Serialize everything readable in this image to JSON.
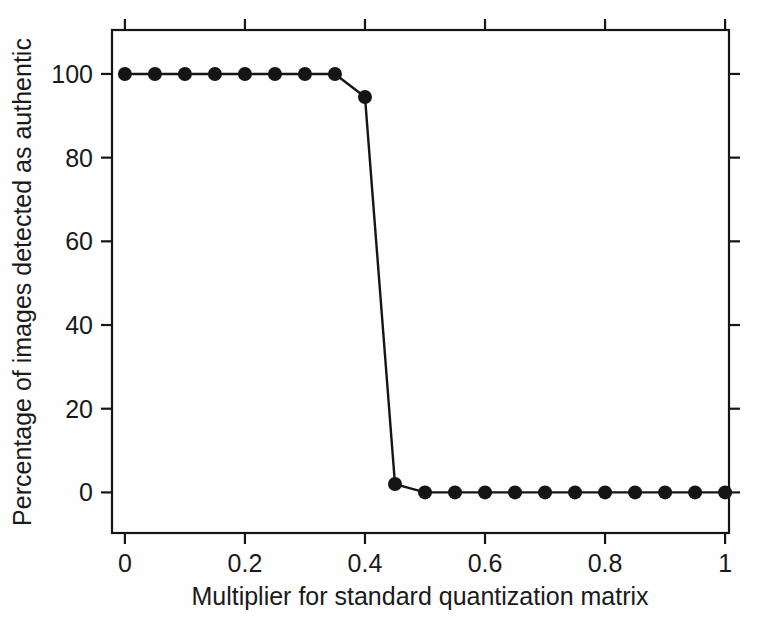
{
  "figure": {
    "background_color": "#fefefe",
    "ink_color": "#151515",
    "frame": {
      "left": 112,
      "right": 729,
      "top": 30,
      "bottom": 533
    }
  },
  "chart_data": {
    "type": "line",
    "title": "",
    "xlabel": "Multiplier for standard quantization matrix",
    "ylabel": "Percentage of images detected as authentic",
    "xlim": [
      -0.0215,
      1.0065
    ],
    "ylim": [
      -9.7,
      110.5
    ],
    "xticks": [
      0,
      0.2,
      0.4,
      0.6,
      0.8,
      1
    ],
    "xticklabels": [
      "0",
      "0.2",
      "0.4",
      "0.6",
      "0.8",
      "1"
    ],
    "yticks": [
      0,
      20,
      40,
      60,
      80,
      100
    ],
    "yticklabels": [
      "0",
      "20",
      "40",
      "60",
      "80",
      "100"
    ],
    "grid": false,
    "legend": null,
    "ticks_direction": "out",
    "ticks_sides": [
      "left",
      "bottom",
      "top",
      "right"
    ],
    "marker": "filled-circle",
    "marker_size": 7,
    "line_width": 2.4,
    "line_color": "#151515",
    "marker_color": "#151515",
    "x": [
      0,
      0.05,
      0.1,
      0.15,
      0.2,
      0.25,
      0.3,
      0.35,
      0.4,
      0.45,
      0.5,
      0.55,
      0.6,
      0.65,
      0.7,
      0.75,
      0.8,
      0.85,
      0.9,
      0.95,
      1
    ],
    "values": [
      100,
      100,
      100,
      100,
      100,
      100,
      100,
      100,
      94.5,
      2,
      0,
      0,
      0,
      0,
      0,
      0,
      0,
      0,
      0,
      0,
      0
    ]
  }
}
